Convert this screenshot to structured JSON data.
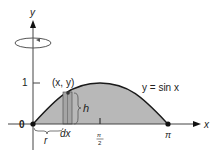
{
  "diagram": {
    "axes": {
      "x_label": "x",
      "y_label": "y",
      "origin_label": "0",
      "y_tick_label": "1",
      "x_tick_mid_num": "π",
      "x_tick_mid_den": "2",
      "x_tick_end_label": "π"
    },
    "curve": {
      "equation_label": "y = sin x",
      "fill_color": "#b8b8b8",
      "stroke_color": "#1a1a1a"
    },
    "strip": {
      "point_label": "(x, y)",
      "height_label": "h",
      "radius_label": "r",
      "width_label": "dx"
    },
    "rotation": {
      "axis": "y",
      "indicator": "rotation-arrow"
    }
  }
}
